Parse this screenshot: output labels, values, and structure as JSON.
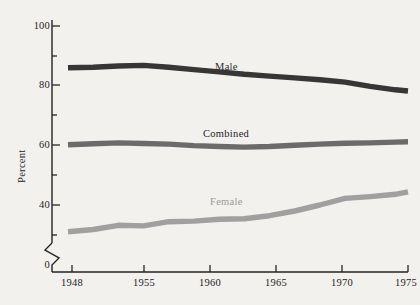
{
  "chart_data": {
    "type": "line",
    "title": "",
    "xlabel": "",
    "ylabel": "Percent",
    "xlim": [
      1948,
      1975
    ],
    "ylim": [
      0,
      100
    ],
    "y_axis_break": true,
    "y_break_label": "0",
    "grid": false,
    "legend_position": "inline-annotations",
    "yticks_major": [
      "100",
      "80",
      "60",
      "40"
    ],
    "yticks_major_values": [
      100,
      80,
      60,
      40
    ],
    "yticks_minor_values": [
      90,
      70,
      50,
      30
    ],
    "xticks": [
      "1948",
      "1955",
      "1960",
      "1965",
      "1970",
      "1975"
    ],
    "xticks_values": [
      1948,
      1955,
      1960,
      1965,
      1970,
      1975
    ],
    "series": [
      {
        "name": "Male",
        "color": "#363636",
        "label_text": "Male",
        "x": [
          1948,
          1950,
          1952,
          1954,
          1956,
          1958,
          1960,
          1962,
          1964,
          1966,
          1968,
          1970,
          1972,
          1974,
          1975
        ],
        "values": [
          86.0,
          86.2,
          86.6,
          86.8,
          86.2,
          85.4,
          84.6,
          83.8,
          83.2,
          82.6,
          82.0,
          81.2,
          79.8,
          78.6,
          78.2
        ]
      },
      {
        "name": "Combined",
        "color": "#6b6b6b",
        "label_text": "Combined",
        "x": [
          1948,
          1950,
          1952,
          1954,
          1956,
          1958,
          1960,
          1962,
          1964,
          1966,
          1968,
          1970,
          1972,
          1974,
          1975
        ],
        "values": [
          60.2,
          60.5,
          60.8,
          60.6,
          60.4,
          59.9,
          59.6,
          59.4,
          59.6,
          60.0,
          60.4,
          60.7,
          60.8,
          61.1,
          61.2
        ]
      },
      {
        "name": "Female",
        "color": "#a0a0a0",
        "label_text": "Female",
        "x": [
          1948,
          1950,
          1952,
          1954,
          1956,
          1958,
          1960,
          1962,
          1964,
          1966,
          1968,
          1970,
          1972,
          1974,
          1975
        ],
        "values": [
          31.0,
          31.8,
          33.2,
          33.0,
          34.4,
          34.6,
          35.2,
          35.4,
          36.4,
          38.0,
          40.0,
          42.2,
          42.8,
          43.6,
          44.4
        ]
      }
    ]
  },
  "axis": {
    "y_title": "Percent",
    "y_labels": [
      "100",
      "80",
      "60",
      "40"
    ],
    "y_zero_label": "0",
    "x_labels": [
      "1948",
      "1955",
      "1960",
      "1965",
      "1970",
      "1975"
    ]
  },
  "annotations": {
    "male": "Male",
    "combined": "Combined",
    "female": "Female"
  },
  "colors": {
    "background": "#f2f1ed",
    "axis": "#26221f",
    "male": "#363636",
    "combined": "#6b6b6b",
    "female": "#a0a0a0"
  }
}
